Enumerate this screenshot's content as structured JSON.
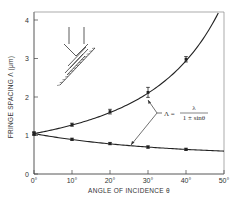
{
  "chart_data": {
    "type": "line",
    "title": "",
    "xlabel": "ANGLE OF INCIDENCE θ",
    "ylabel": "FRINGE SPACING Λ (μm)",
    "xlim": [
      0,
      50
    ],
    "ylim": [
      0,
      4.2
    ],
    "x_ticks": [
      0,
      10,
      20,
      30,
      40,
      50
    ],
    "x_tick_labels": [
      "0°",
      "10°",
      "20°",
      "30°",
      "40°",
      "50°"
    ],
    "y_ticks": [
      0,
      1,
      2,
      3,
      4
    ],
    "y_tick_labels": [
      "0",
      "1",
      "2",
      "3",
      "4"
    ],
    "grid": false,
    "lambda": 1.05,
    "series": [
      {
        "name": "Λ = λ/(1 − sinθ)",
        "curve": "lambda/(1-sin)",
        "points": [
          {
            "x": 0,
            "y": 1.05,
            "err": 0.05
          },
          {
            "x": 10,
            "y": 1.28,
            "err": 0.04
          },
          {
            "x": 20,
            "y": 1.62,
            "err": 0.06
          },
          {
            "x": 30,
            "y": 2.12,
            "err": 0.13
          },
          {
            "x": 40,
            "y": 2.98,
            "err": 0.07
          }
        ]
      },
      {
        "name": "Λ = λ/(1 + sinθ)",
        "curve": "lambda/(1+sin)",
        "points": [
          {
            "x": 0,
            "y": 1.05,
            "err": 0.03
          },
          {
            "x": 10,
            "y": 0.9,
            "err": 0.03
          },
          {
            "x": 20,
            "y": 0.79,
            "err": 0.03
          },
          {
            "x": 30,
            "y": 0.7,
            "err": 0.03
          },
          {
            "x": 40,
            "y": 0.64,
            "err": 0.03
          }
        ]
      }
    ],
    "annotation": {
      "lhs": "Λ =",
      "numerator": "λ",
      "denominator": "1 ± sinθ"
    },
    "inset": "two beams incident on tilted sample (schematic)"
  }
}
